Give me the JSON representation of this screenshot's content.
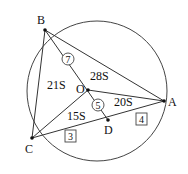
{
  "diagram": {
    "points": {
      "A": {
        "label": "A",
        "x": 164,
        "y": 101
      },
      "B": {
        "label": "B",
        "x": 45,
        "y": 30
      },
      "C": {
        "label": "C",
        "x": 32,
        "y": 138
      },
      "O": {
        "label": "O",
        "x": 88,
        "y": 90
      },
      "D": {
        "label": "D",
        "x": 108,
        "y": 120
      }
    },
    "circle": {
      "cx": 97,
      "cy": 91,
      "r": 70
    },
    "area_labels": {
      "boa": "28S",
      "boc": "21S",
      "aod": "20S",
      "cod": "15S"
    },
    "ratio_circled": {
      "bo": "7",
      "od": "5"
    },
    "ratio_boxed": {
      "cd": "3",
      "da": "4"
    },
    "colors": {
      "stroke": "#333333",
      "text": "#111111"
    }
  }
}
